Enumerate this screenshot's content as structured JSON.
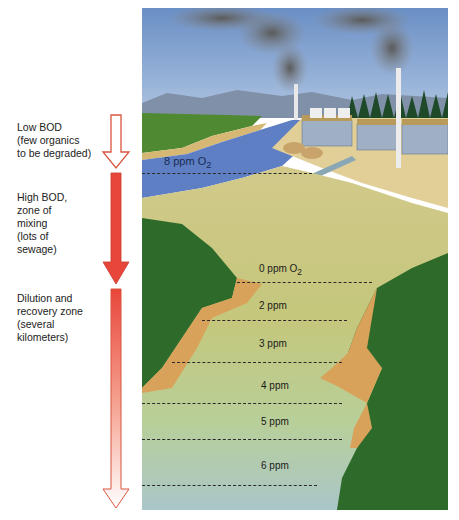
{
  "zones": [
    {
      "label": "Low BOD\n(few organics\nto be degraded)",
      "arrow": "outline"
    },
    {
      "label": "High BOD,\nzone of\nmixing\n(lots of\nsewage)",
      "arrow": "solid-red"
    },
    {
      "label": "Dilution and\nrecovery zone\n(several\nkilometers)",
      "arrow": "gradient-red-to-white"
    }
  ],
  "oxygen_levels": [
    {
      "value": "8 ppm O",
      "sub": "2"
    },
    {
      "value": "0 ppm O",
      "sub": "2"
    },
    {
      "value": "2 ppm"
    },
    {
      "value": "3 ppm"
    },
    {
      "value": "4 ppm"
    },
    {
      "value": "5 ppm"
    },
    {
      "value": "6 ppm"
    }
  ],
  "colors": {
    "arrow_red": "#e8463a",
    "arrow_outline": "#d9553f",
    "sky": "#6f93c8",
    "clean_water": "#5e7fc4",
    "polluted_water": "#c9c27a",
    "grass": "#2e6b2a",
    "bank": "#d9a25a"
  }
}
